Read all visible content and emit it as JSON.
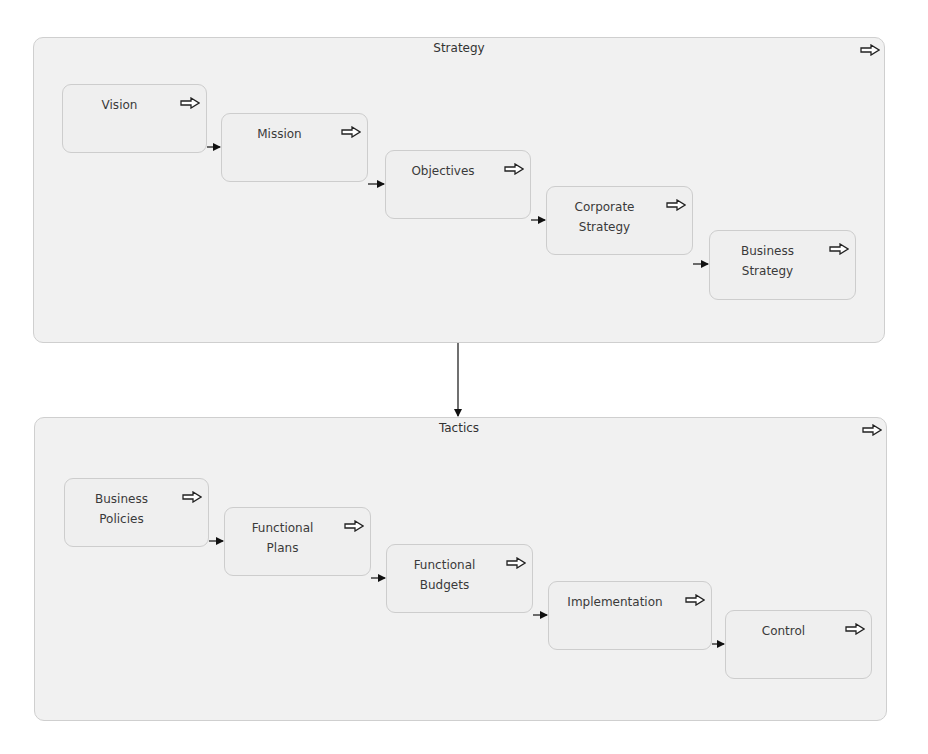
{
  "diagram": {
    "groups": [
      {
        "id": "strategy",
        "title": "Strategy",
        "icon": "hollow-right-arrow-icon",
        "box": {
          "x": 33,
          "y": 37,
          "w": 852,
          "h": 306
        },
        "title_pos": {
          "x": 458,
          "y": 46
        },
        "nodes": [
          {
            "label": "Vision",
            "icon": "hollow-right-arrow-icon",
            "box": {
              "x": 62,
              "y": 84,
              "w": 145,
              "h": 69
            }
          },
          {
            "label": "Mission",
            "icon": "hollow-right-arrow-icon",
            "box": {
              "x": 221,
              "y": 113,
              "w": 147,
              "h": 69
            }
          },
          {
            "label": "Objectives",
            "icon": "hollow-right-arrow-icon",
            "box": {
              "x": 385,
              "y": 150,
              "w": 146,
              "h": 69
            }
          },
          {
            "label": "Corporate\nStrategy",
            "icon": "hollow-right-arrow-icon",
            "box": {
              "x": 546,
              "y": 186,
              "w": 147,
              "h": 69
            }
          },
          {
            "label": "Business\nStrategy",
            "icon": "hollow-right-arrow-icon",
            "box": {
              "x": 709,
              "y": 230,
              "w": 147,
              "h": 70
            }
          }
        ]
      },
      {
        "id": "tactics",
        "title": "Tactics",
        "icon": "hollow-right-arrow-icon",
        "box": {
          "x": 34,
          "y": 417,
          "w": 853,
          "h": 304
        },
        "title_pos": {
          "x": 458,
          "y": 426
        },
        "nodes": [
          {
            "label": "Business\nPolicies",
            "icon": "hollow-right-arrow-icon",
            "box": {
              "x": 64,
              "y": 478,
              "w": 145,
              "h": 69
            }
          },
          {
            "label": "Functional\nPlans",
            "icon": "hollow-right-arrow-icon",
            "box": {
              "x": 224,
              "y": 507,
              "w": 147,
              "h": 69
            }
          },
          {
            "label": "Functional\nBudgets",
            "icon": "hollow-right-arrow-icon",
            "box": {
              "x": 386,
              "y": 544,
              "w": 147,
              "h": 69
            }
          },
          {
            "label": "Implementation",
            "icon": "hollow-right-arrow-icon",
            "box": {
              "x": 548,
              "y": 581,
              "w": 164,
              "h": 69
            }
          },
          {
            "label": "Control",
            "icon": "hollow-right-arrow-icon",
            "box": {
              "x": 725,
              "y": 610,
              "w": 147,
              "h": 69
            }
          }
        ]
      }
    ],
    "group_connector": {
      "from": "Strategy",
      "to": "Tactics",
      "x": 458,
      "y1": 343,
      "y2": 416
    },
    "colors": {
      "group_fill": "#f1f1f1",
      "node_fill": "#efefef",
      "border": "#cdcdcd",
      "text": "#3a3a3a",
      "arrow": "#111111"
    }
  }
}
